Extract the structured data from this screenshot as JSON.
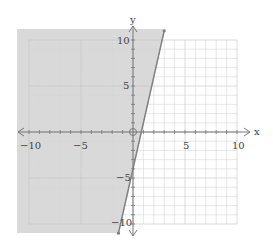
{
  "chart_data": {
    "type": "line",
    "title": "",
    "xlabel": "x",
    "ylabel": "y",
    "xlim": [
      -11,
      11
    ],
    "ylim": [
      -11,
      11
    ],
    "grid": true,
    "x_tick_labels": [
      "-10",
      "-5",
      "5",
      "10"
    ],
    "y_tick_labels": [
      "10",
      "5",
      "-5",
      "-10"
    ],
    "x_ticks": [
      -10,
      -5,
      5,
      10
    ],
    "y_ticks": [
      10,
      5,
      -5,
      -10
    ],
    "boundary_line": {
      "equation": "y = 5x - 4",
      "slope": 5,
      "intercept": -4,
      "style": "solid",
      "points": [
        [
          -1.4,
          -11
        ],
        [
          3,
          11
        ]
      ]
    },
    "shaded_region": "left of line (y >= 5x - 4)",
    "origin_marker": "open circle at (0,0)",
    "colors": {
      "shade": "#d9d9d9",
      "grid": "#d6d6d6",
      "axis": "#777777",
      "line": "#808080"
    }
  }
}
